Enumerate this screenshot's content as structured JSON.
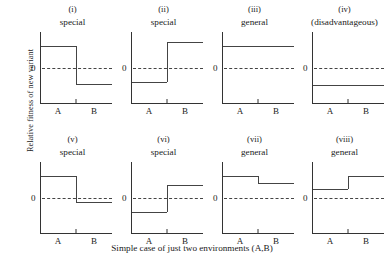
{
  "figure": {
    "ylabel": "Relative fitness of new variant",
    "xcaption": "Simple case of just two environments (A,B)",
    "zero_label": "0",
    "env_a": "A",
    "env_b": "B",
    "line_color": "#444444",
    "axis_color": "#333333"
  },
  "chart_data": {
    "type": "line",
    "title": "",
    "xlabel": "Simple case of just two environments (A,B)",
    "ylabel": "Relative fitness of new variant",
    "categories": [
      "A",
      "B"
    ],
    "ylim": [
      -1,
      1
    ],
    "grid": false,
    "legend": "none",
    "annotations": [
      "zero reference line shown dashed in every panel"
    ],
    "panels": [
      {
        "number": "(i)",
        "title": "special",
        "values": [
          0.62,
          -0.45
        ]
      },
      {
        "number": "(ii)",
        "title": "special",
        "values": [
          -0.4,
          0.72
        ]
      },
      {
        "number": "(iii)",
        "title": "general",
        "values": [
          0.6,
          0.6
        ]
      },
      {
        "number": "(iv)",
        "title": "(disadvantageous)",
        "values": [
          -0.48,
          -0.48
        ]
      },
      {
        "number": "(v)",
        "title": "special",
        "values": [
          0.62,
          -0.1
        ]
      },
      {
        "number": "(vi)",
        "title": "special",
        "values": [
          -0.4,
          0.35
        ]
      },
      {
        "number": "(vii)",
        "title": "general",
        "values": [
          0.62,
          0.42
        ]
      },
      {
        "number": "(viii)",
        "title": "general",
        "values": [
          0.25,
          0.62
        ]
      }
    ]
  }
}
